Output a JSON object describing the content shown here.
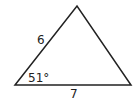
{
  "figure": {
    "type": "triangle",
    "stroke_color": "#222222",
    "vertices": {
      "bottom_left": [
        15,
        85
      ],
      "top": [
        77,
        6
      ],
      "bottom_right": [
        131,
        85
      ]
    },
    "labels": {
      "left_side": "6",
      "bottom_side": "7",
      "angle_bottom_left": "51°"
    }
  }
}
